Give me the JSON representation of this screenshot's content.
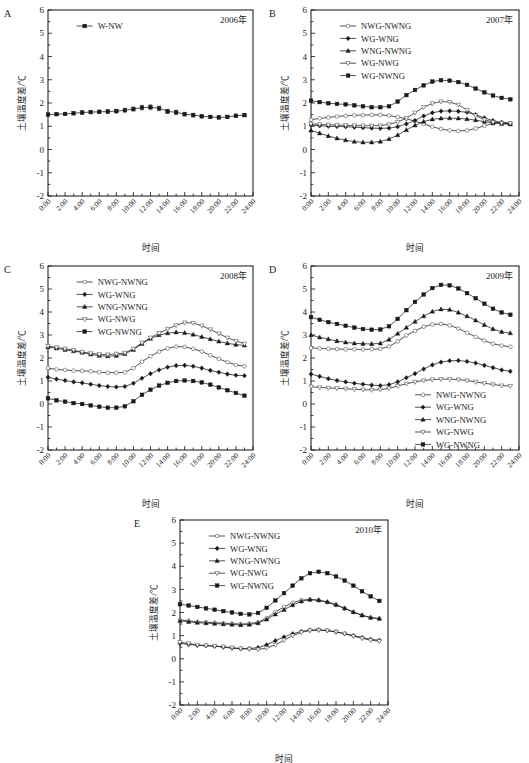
{
  "figure": {
    "axis_titles": {
      "x": "时间",
      "y": "土壤温度差/℃"
    },
    "y_ticks": [
      "-2",
      "-1",
      "0",
      "1",
      "2",
      "3",
      "4",
      "5",
      "6"
    ],
    "y_range": [
      -2,
      6
    ],
    "x_ticks": [
      "0:00",
      "2:00",
      "4:00",
      "6:00",
      "8:00",
      "10:00",
      "12:00",
      "14:00",
      "16:00",
      "18:00",
      "20:00",
      "22:00",
      "24:00"
    ],
    "x_range": [
      0,
      24
    ],
    "grid": false,
    "marker_colors": {
      "line": "#1a1a1a",
      "filled": "#1a1a1a",
      "open": "#ffffff"
    }
  },
  "chart_data": [
    {
      "panel": "A",
      "type": "line",
      "title": "2006年",
      "xlabel": "时间",
      "ylabel": "土壤温度差/℃",
      "ylim": [
        -2,
        6
      ],
      "xlim": [
        0,
        24
      ],
      "legend_position": "top-left",
      "x": [
        0,
        1,
        2,
        3,
        4,
        5,
        6,
        7,
        8,
        9,
        10,
        11,
        12,
        13,
        14,
        15,
        16,
        17,
        18,
        19,
        20,
        21,
        22,
        23
      ],
      "series": [
        {
          "name": "W-NW",
          "marker": "filled-square",
          "errorbars": true,
          "values": [
            1.5,
            1.52,
            1.53,
            1.56,
            1.59,
            1.61,
            1.62,
            1.63,
            1.65,
            1.69,
            1.74,
            1.8,
            1.82,
            1.77,
            1.64,
            1.6,
            1.52,
            1.48,
            1.43,
            1.4,
            1.38,
            1.4,
            1.45,
            1.48
          ],
          "err": [
            0.06,
            0.06,
            0.06,
            0.07,
            0.07,
            0.07,
            0.07,
            0.07,
            0.08,
            0.08,
            0.09,
            0.1,
            0.11,
            0.1,
            0.09,
            0.09,
            0.08,
            0.08,
            0.07,
            0.07,
            0.07,
            0.07,
            0.07,
            0.07
          ]
        }
      ]
    },
    {
      "panel": "B",
      "type": "line",
      "title": "2007年",
      "xlabel": "时间",
      "ylabel": "土壤温度差/℃",
      "ylim": [
        -2,
        6
      ],
      "xlim": [
        0,
        24
      ],
      "legend_position": "top-left",
      "x": [
        0,
        1,
        2,
        3,
        4,
        5,
        6,
        7,
        8,
        9,
        10,
        11,
        12,
        13,
        14,
        15,
        16,
        17,
        18,
        19,
        20,
        21,
        22,
        23
      ],
      "series": [
        {
          "name": "NWG-NWNG",
          "marker": "open-circle",
          "values": [
            1.28,
            1.34,
            1.38,
            1.42,
            1.45,
            1.47,
            1.48,
            1.49,
            1.49,
            1.46,
            1.4,
            1.32,
            1.22,
            1.1,
            0.98,
            0.88,
            0.82,
            0.8,
            0.82,
            0.9,
            1.02,
            1.12,
            1.16,
            1.12
          ]
        },
        {
          "name": "WG-WNG",
          "marker": "filled-diamond",
          "values": [
            1.05,
            1.02,
            1.0,
            0.99,
            0.98,
            0.96,
            0.94,
            0.92,
            0.91,
            0.92,
            0.98,
            1.1,
            1.25,
            1.44,
            1.58,
            1.65,
            1.66,
            1.64,
            1.6,
            1.5,
            1.36,
            1.24,
            1.16,
            1.12
          ]
        },
        {
          "name": "WNG-NWNG",
          "marker": "filled-triangle",
          "values": [
            0.82,
            0.7,
            0.58,
            0.48,
            0.4,
            0.34,
            0.31,
            0.31,
            0.34,
            0.45,
            0.62,
            0.84,
            1.04,
            1.2,
            1.3,
            1.34,
            1.35,
            1.34,
            1.31,
            1.26,
            1.2,
            1.14,
            1.1,
            1.08
          ]
        },
        {
          "name": "WG-NWG",
          "marker": "open-triangle",
          "values": [
            1.1,
            1.08,
            1.06,
            1.05,
            1.04,
            1.03,
            1.02,
            1.02,
            1.03,
            1.08,
            1.18,
            1.35,
            1.58,
            1.82,
            1.98,
            2.06,
            2.04,
            1.92,
            1.7,
            1.46,
            1.28,
            1.18,
            1.14,
            1.12
          ]
        },
        {
          "name": "WG-NWNG",
          "marker": "filled-square",
          "values": [
            2.1,
            2.04,
            1.99,
            1.96,
            1.94,
            1.9,
            1.86,
            1.82,
            1.82,
            1.86,
            2.06,
            2.34,
            2.56,
            2.76,
            2.92,
            2.98,
            2.96,
            2.9,
            2.78,
            2.62,
            2.46,
            2.32,
            2.22,
            2.16
          ]
        }
      ]
    },
    {
      "panel": "C",
      "type": "line",
      "title": "2008年",
      "xlabel": "时间",
      "ylabel": "土壤温度差/℃",
      "ylim": [
        -2,
        6
      ],
      "xlim": [
        0,
        24
      ],
      "legend_position": "top-left",
      "x": [
        0,
        1,
        2,
        3,
        4,
        5,
        6,
        7,
        8,
        9,
        10,
        11,
        12,
        13,
        14,
        15,
        16,
        17,
        18,
        19,
        20,
        21,
        22,
        23
      ],
      "series": [
        {
          "name": "NWG-NWNG",
          "marker": "open-circle",
          "values": [
            1.56,
            1.5,
            1.48,
            1.45,
            1.44,
            1.42,
            1.38,
            1.36,
            1.36,
            1.38,
            1.56,
            1.84,
            2.08,
            2.28,
            2.42,
            2.5,
            2.48,
            2.4,
            2.28,
            2.12,
            1.96,
            1.82,
            1.7,
            1.64
          ]
        },
        {
          "name": "WG-WNG",
          "marker": "filled-diamond",
          "values": [
            1.16,
            1.08,
            1.02,
            0.96,
            0.92,
            0.86,
            0.8,
            0.76,
            0.74,
            0.76,
            0.9,
            1.12,
            1.32,
            1.48,
            1.6,
            1.67,
            1.68,
            1.64,
            1.56,
            1.46,
            1.38,
            1.3,
            1.25,
            1.23
          ]
        },
        {
          "name": "WNG-NWNG",
          "marker": "filled-triangle",
          "values": [
            2.48,
            2.42,
            2.36,
            2.3,
            2.24,
            2.16,
            2.1,
            2.08,
            2.1,
            2.18,
            2.36,
            2.62,
            2.84,
            3.0,
            3.08,
            3.12,
            3.09,
            3.02,
            2.92,
            2.82,
            2.72,
            2.64,
            2.58,
            2.55
          ]
        },
        {
          "name": "WG-NWG",
          "marker": "open-triangle",
          "values": [
            2.52,
            2.46,
            2.4,
            2.34,
            2.26,
            2.2,
            2.16,
            2.15,
            2.18,
            2.22,
            2.4,
            2.66,
            2.88,
            3.08,
            3.26,
            3.42,
            3.54,
            3.52,
            3.4,
            3.24,
            3.06,
            2.88,
            2.74,
            2.62
          ]
        },
        {
          "name": "WG-NWNG",
          "marker": "filled-square",
          "values": [
            0.25,
            0.16,
            0.1,
            0.04,
            0.0,
            -0.06,
            -0.12,
            -0.16,
            -0.16,
            -0.1,
            0.12,
            0.4,
            0.62,
            0.8,
            0.92,
            1.0,
            1.02,
            1.0,
            0.94,
            0.84,
            0.72,
            0.6,
            0.48,
            0.36
          ]
        }
      ]
    },
    {
      "panel": "D",
      "type": "line",
      "title": "2009年",
      "xlabel": "时间",
      "ylabel": "土壤温度差/℃",
      "ylim": [
        -2,
        6
      ],
      "xlim": [
        0,
        24
      ],
      "legend_position": "bottom-right",
      "x": [
        0,
        1,
        2,
        3,
        4,
        5,
        6,
        7,
        8,
        9,
        10,
        11,
        12,
        13,
        14,
        15,
        16,
        17,
        18,
        19,
        20,
        21,
        22,
        23
      ],
      "series": [
        {
          "name": "NWG-NWNG",
          "marker": "open-circle",
          "values": [
            2.44,
            2.42,
            2.4,
            2.39,
            2.38,
            2.38,
            2.37,
            2.38,
            2.4,
            2.5,
            2.72,
            2.98,
            3.18,
            3.36,
            3.46,
            3.48,
            3.42,
            3.28,
            3.1,
            2.92,
            2.76,
            2.62,
            2.54,
            2.49
          ]
        },
        {
          "name": "WG-WNG",
          "marker": "filled-diamond",
          "values": [
            1.3,
            1.2,
            1.1,
            1.02,
            0.96,
            0.9,
            0.86,
            0.82,
            0.8,
            0.84,
            0.96,
            1.14,
            1.32,
            1.52,
            1.7,
            1.82,
            1.88,
            1.89,
            1.85,
            1.78,
            1.68,
            1.58,
            1.48,
            1.42
          ]
        },
        {
          "name": "WNG-NWNG",
          "marker": "filled-triangle",
          "values": [
            3.0,
            2.9,
            2.82,
            2.74,
            2.68,
            2.64,
            2.62,
            2.61,
            2.64,
            2.8,
            3.06,
            3.32,
            3.58,
            3.82,
            4.02,
            4.12,
            4.1,
            3.98,
            3.82,
            3.64,
            3.44,
            3.26,
            3.14,
            3.08
          ]
        },
        {
          "name": "WG-NWG",
          "marker": "open-triangle",
          "values": [
            0.75,
            0.72,
            0.7,
            0.68,
            0.66,
            0.64,
            0.62,
            0.61,
            0.62,
            0.68,
            0.78,
            0.88,
            0.96,
            1.02,
            1.06,
            1.08,
            1.08,
            1.06,
            1.02,
            0.96,
            0.9,
            0.85,
            0.8,
            0.78
          ]
        },
        {
          "name": "WG-NWNG",
          "marker": "filled-square",
          "values": [
            3.78,
            3.66,
            3.56,
            3.48,
            3.4,
            3.32,
            3.26,
            3.23,
            3.24,
            3.38,
            3.7,
            4.08,
            4.44,
            4.76,
            5.04,
            5.18,
            5.16,
            5.02,
            4.82,
            4.6,
            4.36,
            4.14,
            3.98,
            3.88
          ]
        }
      ]
    },
    {
      "panel": "E",
      "type": "line",
      "title": "2010年",
      "xlabel": "时间",
      "ylabel": "土壤温度差/℃",
      "ylim": [
        -2,
        6
      ],
      "xlim": [
        0,
        24
      ],
      "legend_position": "top-left",
      "x": [
        0,
        1,
        2,
        3,
        4,
        5,
        6,
        7,
        8,
        9,
        10,
        11,
        12,
        13,
        14,
        15,
        16,
        17,
        18,
        19,
        20,
        21,
        22,
        23
      ],
      "series": [
        {
          "name": "NWG-NWNG",
          "marker": "open-circle",
          "values": [
            1.68,
            1.64,
            1.6,
            1.58,
            1.56,
            1.54,
            1.52,
            1.5,
            1.52,
            1.58,
            1.76,
            2.02,
            2.24,
            2.42,
            2.54,
            2.56,
            2.52,
            2.44,
            2.32,
            2.18,
            2.02,
            1.88,
            1.78,
            1.72
          ]
        },
        {
          "name": "WG-WNG",
          "marker": "filled-diamond",
          "values": [
            0.66,
            0.62,
            0.58,
            0.56,
            0.54,
            0.5,
            0.46,
            0.43,
            0.44,
            0.48,
            0.6,
            0.78,
            0.94,
            1.08,
            1.18,
            1.24,
            1.25,
            1.22,
            1.16,
            1.08,
            1.0,
            0.92,
            0.84,
            0.8
          ]
        },
        {
          "name": "WNG-NWNG",
          "marker": "filled-triangle",
          "values": [
            1.64,
            1.6,
            1.56,
            1.54,
            1.52,
            1.5,
            1.48,
            1.46,
            1.48,
            1.54,
            1.7,
            1.92,
            2.12,
            2.32,
            2.48,
            2.56,
            2.54,
            2.46,
            2.34,
            2.18,
            2.02,
            1.88,
            1.78,
            1.74
          ]
        },
        {
          "name": "WG-NWG",
          "marker": "open-triangle",
          "values": [
            0.72,
            0.66,
            0.6,
            0.57,
            0.55,
            0.52,
            0.48,
            0.44,
            0.42,
            0.4,
            0.46,
            0.6,
            0.8,
            1.0,
            1.14,
            1.22,
            1.24,
            1.22,
            1.16,
            1.08,
            0.98,
            0.88,
            0.8,
            0.76
          ]
        },
        {
          "name": "WG-NWNG",
          "marker": "filled-square",
          "values": [
            2.36,
            2.3,
            2.24,
            2.18,
            2.12,
            2.06,
            2.0,
            1.94,
            1.92,
            1.98,
            2.2,
            2.52,
            2.84,
            3.16,
            3.48,
            3.7,
            3.76,
            3.7,
            3.56,
            3.38,
            3.16,
            2.92,
            2.7,
            2.5
          ]
        }
      ]
    }
  ]
}
